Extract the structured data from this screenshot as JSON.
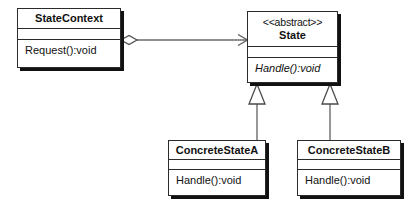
{
  "diagram": {
    "type": "uml-class-diagram",
    "colors": {
      "line": "#6b6b6b",
      "border": "#2b2b2b",
      "shadow": "#111111",
      "fill": "#ffffff",
      "text": "#111111"
    },
    "classes": [
      {
        "id": "statecontext",
        "name": "StateContext",
        "stereotype": "",
        "abstract": false,
        "attributes": [],
        "operations": [
          "Request():void"
        ]
      },
      {
        "id": "state",
        "name": "State",
        "stereotype": "<<abstract>>",
        "abstract": true,
        "attributes": [],
        "operations": [
          "Handle():void"
        ]
      },
      {
        "id": "concretestatea",
        "name": "ConcreteStateA",
        "stereotype": "",
        "abstract": false,
        "attributes": [],
        "operations": [
          "Handle():void"
        ]
      },
      {
        "id": "concretestateb",
        "name": "ConcreteStateB",
        "stereotype": "",
        "abstract": false,
        "attributes": [],
        "operations": [
          "Handle():void"
        ]
      }
    ],
    "relationships": [
      {
        "id": "rel-aggregation",
        "kind": "aggregation",
        "source": "StateContext",
        "target": "State",
        "source_decoration": "hollow-diamond",
        "target_decoration": "open-arrow",
        "label": ""
      },
      {
        "id": "rel-generalization-a",
        "kind": "generalization",
        "source": "ConcreteStateA",
        "target": "State",
        "source_decoration": "none",
        "target_decoration": "hollow-triangle",
        "label": ""
      },
      {
        "id": "rel-generalization-b",
        "kind": "generalization",
        "source": "ConcreteStateB",
        "target": "State",
        "source_decoration": "none",
        "target_decoration": "hollow-triangle",
        "label": ""
      }
    ]
  }
}
